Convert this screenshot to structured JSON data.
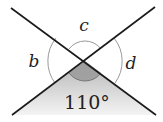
{
  "diagram": {
    "type": "intersecting-lines-angles",
    "labels": {
      "top": "c",
      "left": "b",
      "right": "d",
      "bottom": "110°"
    },
    "given_angle": {
      "position": "bottom",
      "value_deg": 110,
      "text": "110°"
    },
    "unknown_angles": [
      "b",
      "c",
      "d"
    ],
    "colors": {
      "line": "#1a1a1a",
      "arc": "#999999",
      "shade_top": "#b5b5b5",
      "shade_bottom": "#f4f4f4",
      "sector": "#9a9a9a"
    }
  }
}
